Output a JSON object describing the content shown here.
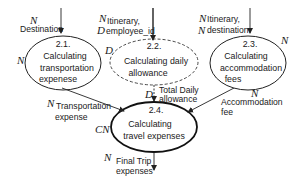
{
  "colors": {
    "stroke": "#222222",
    "text": "#1a1a1a",
    "background": "#ffffff"
  },
  "nodes": [
    {
      "id": "2.1",
      "number": "2.1.",
      "lines": [
        "Calculating",
        "transportation",
        "expenese"
      ],
      "style": "solid"
    },
    {
      "id": "2.2",
      "number": "2.2.",
      "lines": [
        "Calculating daily",
        "allowance"
      ],
      "style": "dashed"
    },
    {
      "id": "2.3",
      "number": "2.3.",
      "lines": [
        "Calculating",
        "accommodation",
        "fees"
      ],
      "style": "solid"
    },
    {
      "id": "2.4",
      "number": "2.4.",
      "lines": [
        "Calculating",
        "travel expenses"
      ],
      "style": "bold"
    }
  ],
  "node_annotations": {
    "n21_left": "N",
    "n22_left": "D",
    "n23_right": "N",
    "n24_left": "CN"
  },
  "flows": {
    "into_21": {
      "tag": "N",
      "label": "Destination"
    },
    "into_22": {
      "tag1": "N",
      "line1": "Itinerary,",
      "tag2": "D",
      "line2": "employee_id"
    },
    "into_23": {
      "tag1": "N",
      "line1": "Itinerary,",
      "tag2": "N",
      "line2": "destination"
    },
    "from_21": {
      "tag": "N",
      "line1": "Transportation",
      "line2": "expense"
    },
    "from_22": {
      "tag": "D",
      "line1": "Total Daily",
      "line2": "allowance"
    },
    "from_23": {
      "tag": "N",
      "line1": "Accommodation",
      "line2": "fee"
    },
    "from_24": {
      "tag": "N",
      "line1": "Final Trip",
      "line2": "expenses"
    }
  }
}
